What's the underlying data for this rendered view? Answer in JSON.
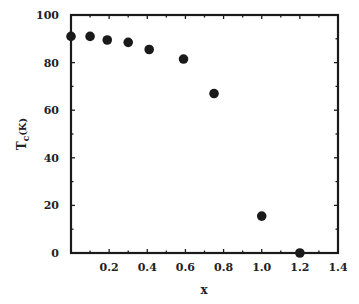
{
  "chart_data": {
    "type": "scatter",
    "title": "",
    "xlabel": "x",
    "ylabel": "Tc (K)",
    "ylabel_main": "T",
    "ylabel_sub": "c",
    "ylabel_unit": "(K)",
    "xlim": [
      0,
      1.4
    ],
    "ylim": [
      0,
      100
    ],
    "xticks": [
      0.2,
      0.4,
      0.6,
      0.8,
      1.0,
      1.2,
      1.4
    ],
    "xtick_labels": [
      "0.2",
      "0.4",
      "0.6",
      "0.8",
      "1.0",
      "1.2",
      "1.4"
    ],
    "yticks": [
      0,
      20,
      40,
      60,
      80,
      100
    ],
    "ytick_labels": [
      "0",
      "20",
      "40",
      "60",
      "80",
      "100"
    ],
    "grid": false,
    "legend": null,
    "series": [
      {
        "name": "Tc",
        "marker": "filled-circle",
        "color": "#1a1a1a",
        "x": [
          0.0,
          0.1,
          0.19,
          0.3,
          0.41,
          0.59,
          0.75,
          1.0,
          1.2
        ],
        "y": [
          91,
          91,
          89.5,
          88.5,
          85.5,
          81.5,
          67,
          15.5,
          0
        ]
      }
    ]
  }
}
